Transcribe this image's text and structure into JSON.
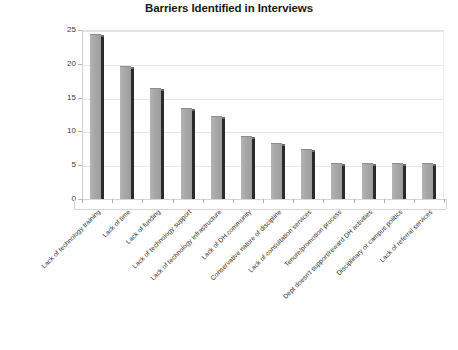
{
  "chart_data": {
    "type": "bar",
    "title": "Barriers Identified in Interviews",
    "xlabel": "",
    "ylabel": "",
    "ylim": [
      0,
      25
    ],
    "yticks": [
      0,
      5,
      10,
      15,
      20,
      25
    ],
    "grid": true,
    "legend": "none",
    "categories": [
      "Lack of technology training",
      "Lack of time",
      "Lack of funding",
      "Lack of technology support",
      "Lack of technology infrastructure",
      "Lack of DH community",
      "Conservative nature of discipline",
      "Lack of consultation services",
      "Tenure/promotion process",
      "Dept doesn't support/reward DH activities",
      "Disciplinary or campus politics",
      "Lack of referral services"
    ],
    "values": [
      24.3,
      19.6,
      16.3,
      13.3,
      12.2,
      9.2,
      8.2,
      7.2,
      5.2,
      5.2,
      5.2,
      5.2
    ],
    "bar_color": "#a8a8a8",
    "bar_shadow_color": "#2b2b2b",
    "grid_color": "#e6e6e6",
    "axis_color": "#9b9b9b"
  },
  "caption": {
    "text": ""
  }
}
